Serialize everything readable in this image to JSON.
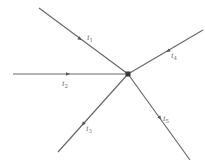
{
  "diagram": {
    "type": "kirchhoff-current-junction",
    "node": {
      "x": 128,
      "y": 74
    },
    "branches": [
      {
        "id": "i1",
        "label": "i",
        "sub": "1",
        "end": {
          "x": 39,
          "y": 8
        },
        "arrow": {
          "x": 80,
          "y": 39,
          "dir": "toward-node"
        },
        "label_pos": {
          "x": 87,
          "y": 40
        }
      },
      {
        "id": "i2",
        "label": "i",
        "sub": "2",
        "end": {
          "x": 13,
          "y": 74
        },
        "arrow": {
          "x": 68,
          "y": 74,
          "dir": "toward-node"
        },
        "label_pos": {
          "x": 62,
          "y": 86
        }
      },
      {
        "id": "i3",
        "label": "i",
        "sub": "3",
        "end": {
          "x": 58,
          "y": 152
        },
        "arrow": {
          "x": 83,
          "y": 124,
          "dir": "away-from-node"
        },
        "label_pos": {
          "x": 86,
          "y": 131
        }
      },
      {
        "id": "i4",
        "label": "i",
        "sub": "4",
        "end": {
          "x": 203,
          "y": 30
        },
        "arrow": {
          "x": 168,
          "y": 51,
          "dir": "toward-node"
        },
        "label_pos": {
          "x": 171,
          "y": 58
        }
      },
      {
        "id": "i5",
        "label": "i",
        "sub": "5",
        "end": {
          "x": 190,
          "y": 160
        },
        "arrow": {
          "x": 160,
          "y": 118,
          "dir": "away-from-node"
        },
        "label_pos": {
          "x": 163,
          "y": 121
        }
      }
    ],
    "colors": {
      "wire": "#6a6a6a",
      "node": "#3a3a3a",
      "label": "#777777"
    }
  }
}
